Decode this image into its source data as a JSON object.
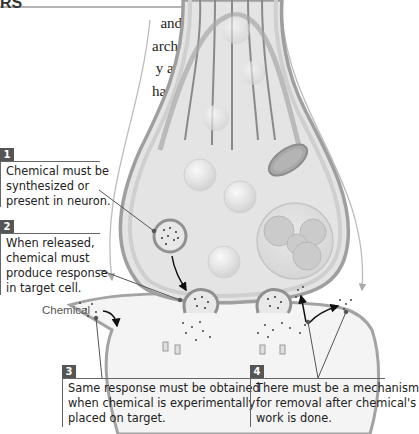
{
  "page": {
    "heading_fragment": "RS",
    "body_lines": [
      "and inhibitory",
      "archers thought",
      "y assumed that",
      "hat epinephrine",
      "these neurons",
      "at we know to-",
      "smitters to con-"
    ]
  },
  "diagram": {
    "chemical_label": "Chemical",
    "callouts": [
      {
        "number": "1",
        "lines": [
          "Chemical must be",
          "synthesized or",
          "present in neuron."
        ]
      },
      {
        "number": "2",
        "lines": [
          "When released,",
          "chemical must",
          "produce response",
          "in target cell."
        ]
      },
      {
        "number": "3",
        "lines": [
          "Same response must be obtained",
          "when chemical is experimentally",
          "placed on target."
        ]
      },
      {
        "number": "4",
        "lines": [
          "There must be a mechanism",
          "for removal after chemical's",
          "work is done."
        ]
      }
    ],
    "colors": {
      "membrane": "#9a9a9a",
      "cytoplasm": "#e6e6e6",
      "number_box": "#555555",
      "arrow": "#111111"
    }
  }
}
